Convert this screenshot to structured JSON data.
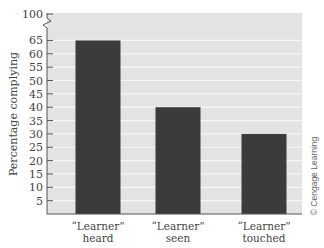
{
  "chart_data": {
    "type": "bar",
    "title": "",
    "xlabel": "",
    "ylabel": "Percentage complying",
    "categories": [
      "“Learner” heard",
      "“Learner” seen",
      "“Learner” touched"
    ],
    "category_lines": [
      [
        "“Learner”",
        "heard"
      ],
      [
        "“Learner”",
        "seen"
      ],
      [
        "“Learner”",
        "touched"
      ]
    ],
    "values": [
      65,
      40,
      30
    ],
    "ylim": [
      0,
      100
    ],
    "axis_break": {
      "from": 65,
      "to": 100
    },
    "yticks": [
      5,
      10,
      15,
      20,
      25,
      30,
      35,
      40,
      45,
      50,
      55,
      60,
      65,
      100
    ],
    "grid": true,
    "legend": null,
    "annotations": [
      "© Cengage Learning"
    ]
  },
  "colors": {
    "plot_background": "#e3e3e3",
    "bar": "#3b3b3b",
    "gridline": "#f7f7f7",
    "axis": "#555555",
    "text": "#444444"
  },
  "labels": {
    "ylabel": "Percentage complying",
    "credit": "© Cengage Learning",
    "tick_100": "100"
  }
}
